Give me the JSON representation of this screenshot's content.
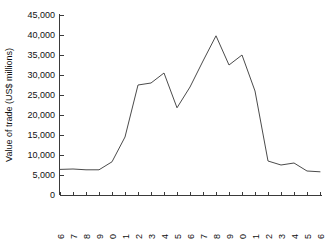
{
  "chart_data": {
    "type": "line",
    "title": "",
    "subtitle": "",
    "xlabel": "",
    "ylabel": "Value of trade (US$ millions)",
    "categories": [
      "1996",
      "1997",
      "1998",
      "1999",
      "2000",
      "2001",
      "2002",
      "2003",
      "2004",
      "2005",
      "2006",
      "2007",
      "2008",
      "2009",
      "2010",
      "2011",
      "2012",
      "2013",
      "2014",
      "2015",
      "2016"
    ],
    "values": [
      6400,
      6500,
      6300,
      6300,
      8300,
      14500,
      27500,
      28000,
      30500,
      21800,
      27000,
      33500,
      39800,
      32500,
      35000,
      26000,
      8500,
      7500,
      8000,
      6000,
      5800
    ],
    "series": [
      {
        "name": "Value of trade",
        "values": [
          6400,
          6500,
          6300,
          6300,
          8300,
          14500,
          27500,
          28000,
          30500,
          21800,
          27000,
          33500,
          39800,
          32500,
          35000,
          26000,
          8500,
          7500,
          8000,
          6000,
          5800
        ]
      }
    ],
    "ylim": [
      0,
      45000
    ],
    "xlim": [
      "1996",
      "2016"
    ],
    "ytick_labels": [
      "0",
      "5,000",
      "10,000",
      "15,000",
      "20,000",
      "25,000",
      "30,000",
      "35,000",
      "40,000",
      "45,000"
    ],
    "ytick_values": [
      0,
      5000,
      10000,
      15000,
      20000,
      25000,
      30000,
      35000,
      40000,
      45000
    ],
    "xtick_labels": [
      "1996",
      "1997",
      "1998",
      "1999",
      "2000",
      "2001",
      "2002",
      "2003",
      "2004",
      "2005",
      "2006",
      "2007",
      "2008",
      "2009",
      "2010",
      "2011",
      "2012",
      "2013",
      "2014",
      "2015",
      "2016"
    ],
    "grid": false,
    "legend": false,
    "legend_position": "none",
    "line_color": "#4b4b4b",
    "axis_color": "#3a3a3a",
    "background_color": "#ffffff"
  }
}
